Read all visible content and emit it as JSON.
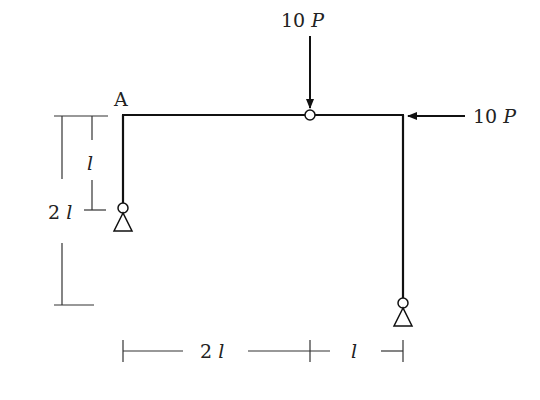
{
  "diagram": {
    "type": "structural frame",
    "node_label": "A",
    "loads": [
      {
        "name": "vertical-load",
        "coef": "10",
        "var": "P",
        "direction": "down",
        "applied_at": "hinge on top beam"
      },
      {
        "name": "horizontal-load",
        "coef": "10",
        "var": "P",
        "direction": "left",
        "applied_at": "top right corner"
      }
    ],
    "dimensions": {
      "left_inner": {
        "coef": "",
        "var": "l"
      },
      "left_outer": {
        "coef": "2",
        "var": "l"
      },
      "bottom_left": {
        "coef": "2",
        "var": "l"
      },
      "bottom_right": {
        "coef": "",
        "var": "l"
      }
    },
    "supports": [
      "pin support at left column base",
      "pin support at right column base"
    ],
    "hinges": [
      "internal hinge on top beam"
    ]
  }
}
